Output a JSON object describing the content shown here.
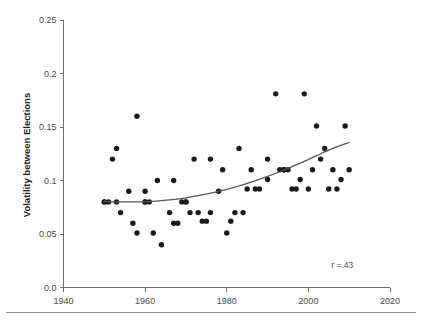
{
  "figure": {
    "ghost_caption": "",
    "footer_rule": true
  },
  "chart_data": {
    "type": "scatter",
    "title": "",
    "xlabel": "",
    "ylabel": "Volatility between Elections",
    "xlim": [
      1940,
      2020
    ],
    "ylim": [
      0.0,
      0.25
    ],
    "grid": false,
    "legend": null,
    "xticks": [
      1940,
      1960,
      1980,
      2000,
      2020
    ],
    "xtick_labels": [
      "1940",
      "1960",
      "1980",
      "2000",
      "2020"
    ],
    "yticks": [
      0.0,
      0.05,
      0.1,
      0.15,
      0.2,
      0.25
    ],
    "ytick_labels": [
      "0.0",
      "0.05",
      "0.1",
      "0.15",
      "0.2",
      "0.25"
    ],
    "annotations": [
      {
        "text": "r =.43",
        "x": 2011,
        "y": 0.018
      }
    ],
    "series": [
      {
        "name": "Elections",
        "marker": "circle",
        "color": "#1a1a1a",
        "points": [
          [
            1950,
            0.08
          ],
          [
            1950,
            0.08
          ],
          [
            1951,
            0.08
          ],
          [
            1952,
            0.12
          ],
          [
            1953,
            0.13
          ],
          [
            1953,
            0.08
          ],
          [
            1954,
            0.07
          ],
          [
            1956,
            0.09
          ],
          [
            1957,
            0.06
          ],
          [
            1958,
            0.16
          ],
          [
            1958,
            0.051
          ],
          [
            1960,
            0.08
          ],
          [
            1960,
            0.08
          ],
          [
            1960,
            0.09
          ],
          [
            1961,
            0.08
          ],
          [
            1962,
            0.051
          ],
          [
            1963,
            0.1
          ],
          [
            1964,
            0.04
          ],
          [
            1966,
            0.07
          ],
          [
            1967,
            0.06
          ],
          [
            1967,
            0.1
          ],
          [
            1968,
            0.06
          ],
          [
            1969,
            0.08
          ],
          [
            1970,
            0.08
          ],
          [
            1970,
            0.08
          ],
          [
            1971,
            0.07
          ],
          [
            1972,
            0.12
          ],
          [
            1973,
            0.07
          ],
          [
            1974,
            0.062
          ],
          [
            1975,
            0.062
          ],
          [
            1976,
            0.12
          ],
          [
            1976,
            0.07
          ],
          [
            1978,
            0.09
          ],
          [
            1979,
            0.11
          ],
          [
            1980,
            0.051
          ],
          [
            1981,
            0.062
          ],
          [
            1982,
            0.07
          ],
          [
            1983,
            0.13
          ],
          [
            1984,
            0.07
          ],
          [
            1985,
            0.092
          ],
          [
            1986,
            0.11
          ],
          [
            1987,
            0.092
          ],
          [
            1988,
            0.092
          ],
          [
            1990,
            0.12
          ],
          [
            1990,
            0.101
          ],
          [
            1992,
            0.181
          ],
          [
            1993,
            0.11
          ],
          [
            1994,
            0.11
          ],
          [
            1994,
            0.11
          ],
          [
            1995,
            0.11
          ],
          [
            1996,
            0.092
          ],
          [
            1997,
            0.092
          ],
          [
            1998,
            0.101
          ],
          [
            1999,
            0.181
          ],
          [
            2000,
            0.092
          ],
          [
            2001,
            0.11
          ],
          [
            2002,
            0.151
          ],
          [
            2003,
            0.12
          ],
          [
            2004,
            0.13
          ],
          [
            2005,
            0.092
          ],
          [
            2006,
            0.11
          ],
          [
            2007,
            0.092
          ],
          [
            2008,
            0.101
          ],
          [
            2009,
            0.151
          ],
          [
            2010,
            0.11
          ]
        ]
      }
    ],
    "trend": {
      "name": "lowess-fit",
      "color": "#555555",
      "points": [
        [
          1950,
          0.0805
        ],
        [
          1954,
          0.08
        ],
        [
          1958,
          0.08
        ],
        [
          1962,
          0.0805
        ],
        [
          1966,
          0.0818
        ],
        [
          1970,
          0.0838
        ],
        [
          1974,
          0.0865
        ],
        [
          1978,
          0.0898
        ],
        [
          1982,
          0.0938
        ],
        [
          1986,
          0.0985
        ],
        [
          1990,
          0.1038
        ],
        [
          1994,
          0.1098
        ],
        [
          1998,
          0.1162
        ],
        [
          2002,
          0.1232
        ],
        [
          2006,
          0.13
        ],
        [
          2010,
          0.1355
        ]
      ]
    }
  }
}
